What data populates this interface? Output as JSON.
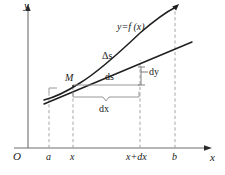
{
  "figure": {
    "axes": {
      "y_label": "y",
      "x_label": "x",
      "origin_label": "O"
    },
    "x_ticks": [
      {
        "id": "a",
        "label": "a",
        "x": 49
      },
      {
        "id": "x",
        "label": "x",
        "x": 73
      },
      {
        "id": "x_plus_dx",
        "label": "x+dx",
        "x": 140
      },
      {
        "id": "b",
        "label": "b",
        "x": 175
      }
    ],
    "curve": {
      "label": "y=f (x)",
      "color": "#1a1a1a"
    },
    "tangent": {
      "color": "#1a1a1a"
    },
    "annotations": {
      "point_m": "M",
      "delta_s": "Δs",
      "ds": "ds",
      "dy": "dy",
      "dx": "dx"
    },
    "colors": {
      "ink": "#1a1a1a",
      "axis": "#4a4a4a",
      "dashed": "#8a8a8a",
      "thin": "#9a9a9a",
      "background": "#ffffff"
    }
  }
}
